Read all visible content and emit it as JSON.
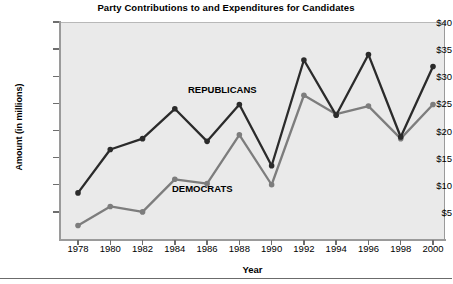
{
  "chart_data": {
    "type": "line",
    "title": "Party Contributions to and Expenditures for Candidates",
    "xlabel": "Year",
    "ylabel": "Amount (in millions)",
    "categories": [
      1978,
      1980,
      1982,
      1984,
      1986,
      1988,
      1990,
      1992,
      1994,
      1996,
      1998,
      2000
    ],
    "xtick_labels": [
      "1978",
      "1980",
      "1982",
      "1984",
      "1986",
      "1988",
      "1990",
      "1992",
      "1994",
      "1996",
      "1998",
      "2000"
    ],
    "ytick_labels": [
      "$5",
      "$10",
      "$15",
      "$20",
      "$25",
      "$30",
      "$35",
      "$40"
    ],
    "ytick_values": [
      5,
      10,
      15,
      20,
      25,
      30,
      35,
      40
    ],
    "ylim": [
      0,
      40
    ],
    "grid": false,
    "legend_position": "inline-annotations",
    "series": [
      {
        "name": "REPUBLICANS",
        "color": "#2b2b2b",
        "values": [
          8.5,
          16.5,
          18.5,
          24.0,
          18.0,
          24.8,
          13.5,
          33.0,
          22.8,
          34.0,
          18.8,
          31.8
        ]
      },
      {
        "name": "DEMOCRATS",
        "color": "#7d7d7d",
        "values": [
          2.5,
          6.0,
          5.0,
          11.0,
          10.2,
          19.2,
          10.0,
          26.5,
          23.0,
          24.5,
          18.5,
          24.8
        ]
      }
    ],
    "annotations": [
      {
        "text": "REPUBLICANS",
        "x": 1986,
        "y": 28.5
      },
      {
        "text": "DEMOCRATS",
        "x": 1985,
        "y": 10.8
      }
    ]
  }
}
